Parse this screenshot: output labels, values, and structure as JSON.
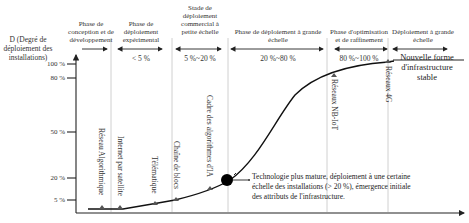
{
  "y_axis": {
    "label": "D (Degré de déploiement des installations)",
    "ticks": [
      "100 %",
      "80 %",
      "50 %",
      "20 %",
      "5 %"
    ]
  },
  "phases": [
    {
      "title": "Phase de conception et de développement",
      "range": ""
    },
    {
      "title": "Phase de déploiement expérimental",
      "range": "< 5 %"
    },
    {
      "title": "Stade de déploiement commercial à petite échelle",
      "range": "5 %~20 %"
    },
    {
      "title": "Phase de déploiement à grande échelle",
      "range": "20 %~80 %"
    },
    {
      "title": "Phase d'optimisation et de raffinement",
      "range": "80 %~100 %"
    },
    {
      "title": "Déploiement à grande échelle",
      "range": ""
    }
  ],
  "milestones": [
    {
      "label": "Réseau Algorithmique"
    },
    {
      "label": "Internet par satellite"
    },
    {
      "label": "Télématique"
    },
    {
      "label": "Chaîne de blocs"
    },
    {
      "label": "Cadre des algorithmes d'IA"
    },
    {
      "label": "Réseaux NB-IoT"
    },
    {
      "label": "Réseaux 4G"
    }
  ],
  "annotation": {
    "text": "Technologie plus mature, déploiement à une certaine échelle des installations (> 20 %), émergence initiale des attributs de l'infrastructure."
  },
  "end_state": {
    "text": "Nouvelle forme d'infrastructure stable"
  },
  "colors": {
    "curve": "#111111",
    "axis": "#222222",
    "divider": "#bbbbbb",
    "marker": "#555555"
  }
}
